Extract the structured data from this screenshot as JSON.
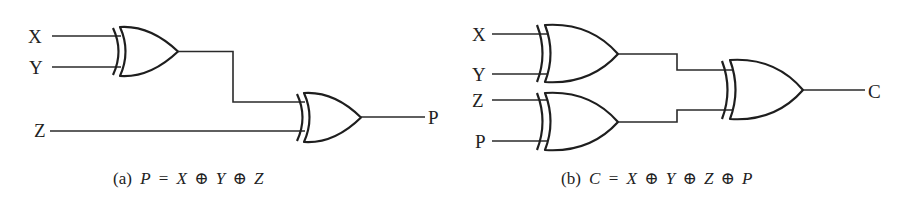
{
  "figure": {
    "panel_a": {
      "inputs": [
        "X",
        "Y",
        "Z"
      ],
      "output": "P",
      "caption": {
        "tag": "(a)",
        "lhs": "P",
        "eq": "=",
        "terms": [
          "X",
          "Y",
          "Z"
        ],
        "operator": "⊕"
      },
      "gates": [
        {
          "type": "XOR",
          "inputs": [
            "X",
            "Y"
          ],
          "output": "X⊕Y"
        },
        {
          "type": "XOR",
          "inputs": [
            "X⊕Y",
            "Z"
          ],
          "output": "P"
        }
      ]
    },
    "panel_b": {
      "inputs": [
        "X",
        "Y",
        "Z",
        "P"
      ],
      "output": "C",
      "caption": {
        "tag": "(b)",
        "lhs": "C",
        "eq": "=",
        "terms": [
          "X",
          "Y",
          "Z",
          "P"
        ],
        "operator": "⊕"
      },
      "gates": [
        {
          "type": "XOR",
          "inputs": [
            "X",
            "Y"
          ],
          "output": "X⊕Y"
        },
        {
          "type": "XOR",
          "inputs": [
            "Z",
            "P"
          ],
          "output": "Z⊕P"
        },
        {
          "type": "XOR",
          "inputs": [
            "X⊕Y",
            "Z⊕P"
          ],
          "output": "C"
        }
      ]
    },
    "colors": {
      "ink": "#1e1e1e",
      "background": "#ffffff"
    }
  }
}
